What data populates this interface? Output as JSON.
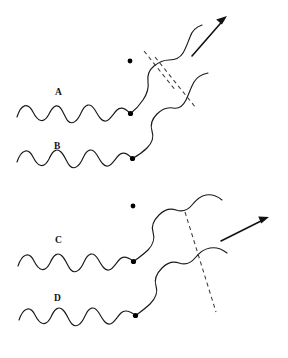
{
  "figure": {
    "title": "",
    "background_color": "#ffffff",
    "stroke_color": "#1a1a1a",
    "dash_color": "#3a3a3a",
    "arrow_color": "#111111",
    "dot_color": "#000000",
    "width": 288,
    "height": 358
  },
  "panels": [
    {
      "id": "upper",
      "labels": [
        {
          "text": "A",
          "x": 55,
          "y": 88
        },
        {
          "text": "B",
          "x": 54,
          "y": 142
        }
      ],
      "free_dot": {
        "x": 130,
        "y": 61,
        "r": 2.4
      },
      "scatter_dots": [
        {
          "x": 130.5,
          "y": 113.5,
          "r": 2.6
        },
        {
          "x": 132.5,
          "y": 158.5,
          "r": 2.6
        }
      ],
      "arrow": {
        "from_x": 192,
        "from_y": 56,
        "to_x": 227,
        "to_y": 16,
        "head_size": 7
      },
      "dashed_lines": [
        {
          "x1": 144,
          "y1": 51,
          "x2": 176,
          "y2": 91
        },
        {
          "x1": 155,
          "y1": 57,
          "x2": 196,
          "y2": 108
        }
      ]
    },
    {
      "id": "lower",
      "labels": [
        {
          "text": "C",
          "x": 55,
          "y": 236
        },
        {
          "text": "D",
          "x": 54,
          "y": 294
        }
      ],
      "free_dot": {
        "x": 133,
        "y": 206,
        "r": 2.4
      },
      "scatter_dots": [
        {
          "x": 133.5,
          "y": 261.5,
          "r": 2.6
        },
        {
          "x": 135.5,
          "y": 315.5,
          "r": 2.6
        }
      ],
      "arrow": {
        "from_x": 221,
        "from_y": 241,
        "to_x": 269,
        "to_y": 217,
        "head_size": 7
      },
      "dashed_lines": [
        {
          "x1": 185,
          "y1": 212,
          "x2": 216,
          "y2": 312
        }
      ]
    }
  ],
  "waves": {
    "incoming_upper_a": {
      "name": "wave-A-incoming",
      "start_x": 17,
      "start_y": 112,
      "end_x": 130,
      "end_y": 113,
      "cycles": 3.5,
      "amplitude": 9
    },
    "incoming_upper_b": {
      "name": "wave-B-incoming",
      "start_x": 17,
      "start_y": 157,
      "end_x": 132,
      "end_y": 158,
      "cycles": 3.5,
      "amplitude": 9
    },
    "incoming_lower_c": {
      "name": "wave-C-incoming",
      "start_x": 18,
      "start_y": 261,
      "end_x": 133,
      "end_y": 261,
      "cycles": 3.5,
      "amplitude": 9
    },
    "incoming_lower_d": {
      "name": "wave-D-incoming",
      "start_x": 19,
      "start_y": 315,
      "end_x": 135,
      "end_y": 315,
      "cycles": 3.5,
      "amplitude": 9
    },
    "outgoing_upper_a": {
      "name": "wave-A-outgoing",
      "amplitude": 10
    },
    "outgoing_upper_b": {
      "name": "wave-B-outgoing",
      "amplitude": 10
    },
    "outgoing_lower_c": {
      "name": "wave-C-outgoing",
      "amplitude": 10
    },
    "outgoing_lower_d": {
      "name": "wave-D-outgoing",
      "amplitude": 10
    }
  },
  "paths": {
    "upper_a_incoming": "M 17 117 C 21 104, 28 102, 33 112 C 38 122, 44 124, 49 114 C 52.5 107, 56 104, 59.5 107 C 63 110, 65 118, 68 121 C 72 125, 77 122, 81 113 C 85 104, 90 102, 95 110 C 99 117, 102 122, 106 121 C 110 120, 113 114, 117 110 C 121 106, 126 109, 130 113",
    "upper_a_outgoing": "M 130.5 113.5 C 135 110, 139 106, 143 100 C 147 94, 149 88, 148 82 C 147.2 76, 149 70, 154 66 C 159 62, 164 60, 169 60 C 175 60, 180 58, 183 53 C 186 48, 188 42, 190 37 C 192 31, 196 27, 202 25",
    "upper_b_incoming": "M 17 162 C 21 150, 28 147, 33 157 C 38 167, 44 169, 49 159 C 53 150, 57 148, 61 152 C 65 156, 67 163, 70 166 C 74 170, 79 167, 83 158 C 87 149, 92 147, 97 155 C 101 162, 104 167, 108 166 C 112 165, 115 159, 119 155 C 123 151, 128 154, 132 158",
    "upper_b_outgoing": "M 132.5 158.5 C 137 156, 142 153, 147 148 C 152 143, 154 137, 152 131 C 150 125, 152 119, 157 114 C 162 109, 168 107, 173 108 C 178 109, 183 106, 186 100 C 189 94, 191 87, 194 82 C 197 77, 202 74, 208 73",
    "lower_c_incoming": "M 18 266 C 22 254, 29 251, 34 261 C 39 271, 45 273, 50 263 C 54 254, 58 252, 62 256 C 66 260, 68 267, 71 270 C 75 274, 80 271, 84 262 C 88 253, 93 251, 98 259 C 102 266, 105 271, 109 270 C 113 269, 116 263, 120 259 C 124 255, 129 258, 133 261",
    "lower_c_outgoing": "M 133.5 261.5 C 138 258, 143 255, 148 250 C 153 245, 155 238, 153 232 C 151 226, 154 220, 159 215 C 164 210, 170 208, 176 210 C 182 212, 188 210, 192 205 C 196 200, 200 196, 206 195 C 212 194, 217 196, 222 200",
    "lower_d_incoming": "M 19 320 C 23 308, 30 305, 35 315 C 40 325, 46 327, 51 317 C 55 308, 59 306, 63 310 C 67 314, 69 321, 72 324 C 76 328, 81 325, 85 316 C 89 307, 94 305, 99 313 C 103 320, 106 325, 110 324 C 114 323, 117 317, 121 313 C 125 309, 131 312, 135 315",
    "lower_d_outgoing": "M 135.5 315.5 C 140 312, 145 309, 150 304 C 155 299, 158 292, 156 286 C 154 280, 157 273, 162 268 C 167 263, 173 261, 179 263 C 185 265, 191 263, 195 258 C 199 253, 204 249, 210 248 C 216 247, 222 249, 227 253"
  }
}
